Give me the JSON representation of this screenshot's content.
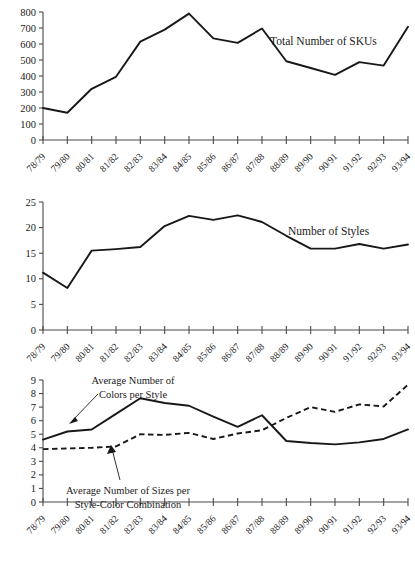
{
  "figure": {
    "categories": [
      "78/79",
      "79/80",
      "80/81",
      "81/82",
      "82/83",
      "83/84",
      "84/85",
      "85/86",
      "86/87",
      "87/88",
      "88/89",
      "89/90",
      "90/91",
      "91/92",
      "92/93",
      "93/94"
    ]
  },
  "chart_data": [
    {
      "type": "line",
      "title": "Total Number of SKUs",
      "xlabel": "",
      "ylabel": "",
      "ylim": [
        0,
        800
      ],
      "yticks": [
        0,
        100,
        200,
        300,
        400,
        500,
        600,
        700,
        800
      ],
      "ytick_labels": [
        "0",
        "100",
        "200",
        "300",
        "400",
        "500",
        "600",
        "700",
        "800"
      ],
      "grid": false,
      "legend_position": "inline-right",
      "categories": [
        "78/79",
        "79/80",
        "80/81",
        "81/82",
        "82/83",
        "83/84",
        "84/85",
        "85/86",
        "86/87",
        "87/88",
        "88/89",
        "89/90",
        "90/91",
        "91/92",
        "92/93",
        "93/94"
      ],
      "series": [
        {
          "name": "Total Number of SKUs",
          "style": "solid",
          "values": [
            200,
            170,
            320,
            395,
            615,
            690,
            790,
            635,
            607,
            697,
            492,
            450,
            407,
            487,
            465,
            708
          ]
        }
      ]
    },
    {
      "type": "line",
      "title": "Number of Styles",
      "xlabel": "",
      "ylabel": "",
      "ylim": [
        0,
        25
      ],
      "yticks": [
        0,
        5,
        10,
        15,
        20,
        25
      ],
      "ytick_labels": [
        "0",
        "5",
        "10",
        "15",
        "20",
        "25"
      ],
      "grid": false,
      "legend_position": "inline-right",
      "categories": [
        "78/79",
        "79/80",
        "80/81",
        "81/82",
        "82/83",
        "83/84",
        "84/85",
        "85/86",
        "86/87",
        "87/88",
        "88/89",
        "89/90",
        "90/91",
        "91/92",
        "92/93",
        "93/94"
      ],
      "series": [
        {
          "name": "Number of Styles",
          "style": "solid",
          "values": [
            11.2,
            8.2,
            15.5,
            15.8,
            16.2,
            20.3,
            22.3,
            21.5,
            22.4,
            21.1,
            18.4,
            15.9,
            15.9,
            16.8,
            15.9,
            16.7
          ]
        }
      ]
    },
    {
      "type": "line",
      "title": "",
      "xlabel": "",
      "ylabel": "",
      "ylim": [
        0,
        9
      ],
      "yticks": [
        0,
        1,
        2,
        3,
        4,
        5,
        6,
        7,
        8,
        9
      ],
      "ytick_labels": [
        "0",
        "1",
        "2",
        "3",
        "4",
        "5",
        "6",
        "7",
        "8",
        "9"
      ],
      "grid": false,
      "legend_position": "annotated",
      "categories": [
        "78/79",
        "79/80",
        "80/81",
        "81/82",
        "82/83",
        "83/84",
        "84/85",
        "85/86",
        "86/87",
        "87/88",
        "88/89",
        "89/90",
        "90/91",
        "91/92",
        "92/93",
        "93/94"
      ],
      "series": [
        {
          "name": "Average Number of Colors per Style",
          "style": "solid",
          "values": [
            4.6,
            5.2,
            5.35,
            6.5,
            7.65,
            7.3,
            7.1,
            6.3,
            5.55,
            6.4,
            4.5,
            4.35,
            4.25,
            4.4,
            4.65,
            5.35
          ]
        },
        {
          "name": "Average Number of Sizes per Style-Color Combination",
          "style": "dashed",
          "values": [
            3.9,
            3.95,
            4.0,
            4.1,
            5.0,
            4.95,
            5.1,
            4.65,
            5.05,
            5.3,
            6.2,
            7.0,
            6.65,
            7.2,
            7.05,
            8.65
          ]
        }
      ],
      "annotations": [
        {
          "name": "colors-annotation",
          "lines": [
            "Average Number of",
            "Colors per Style"
          ]
        },
        {
          "name": "sizes-annotation",
          "lines": [
            "Average Number of Sizes per",
            "Style-Color Combination"
          ]
        }
      ]
    }
  ],
  "colors": {
    "line": "#181818",
    "axis": "#4a4a4a",
    "background": "#ffffff"
  }
}
